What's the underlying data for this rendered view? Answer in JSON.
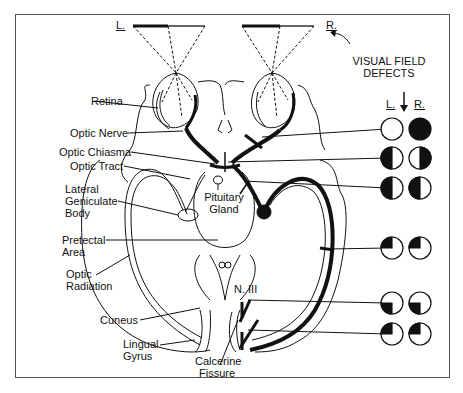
{
  "field_markers": {
    "left": "L.",
    "right": "R."
  },
  "defects_title": {
    "line1": "VISUAL FIELD",
    "line2": "DEFECTS"
  },
  "defects_columns": {
    "left": "L.",
    "right": "R."
  },
  "labels": {
    "retina": "Retina",
    "optic_nerve": "Optic Nerve",
    "optic_chiasma": "Optic Chiasma",
    "optic_tract": "Optic Tract",
    "lgb_1": "Lateral",
    "lgb_2": "Geniculate",
    "lgb_3": "Body",
    "pretectal_1": "Pretectal",
    "pretectal_2": "Area",
    "radiation_1": "Optic",
    "radiation_2": "Radiation",
    "cuneus": "Cuneus",
    "lingual_1": "Lingual",
    "lingual_2": "Gyrus",
    "pituitary_1": "Pituitary",
    "pituitary_2": "Gland",
    "n3": "N. III",
    "calcarine_1": "Calcerine",
    "calcarine_2": "Fissure"
  },
  "defects": [
    {
      "lesion": "Optic nerve",
      "left_eye": "normal",
      "right_eye": "full blindness"
    },
    {
      "lesion": "Optic chiasma",
      "left_eye": "temporal (left) half blind",
      "right_eye": "temporal (right) half blind"
    },
    {
      "lesion": "Optic tract",
      "left_eye": "left half blind",
      "right_eye": "left half blind"
    },
    {
      "lesion": "Optic radiation (Meyer loop)",
      "left_eye": "upper-left quadrant",
      "right_eye": "upper-left quadrant"
    },
    {
      "lesion": "Cuneus",
      "left_eye": "lower-left quadrant",
      "right_eye": "lower-left quadrant"
    },
    {
      "lesion": "Lingual gyrus",
      "left_eye": "upper-left quadrant",
      "right_eye": "upper-left quadrant"
    }
  ]
}
